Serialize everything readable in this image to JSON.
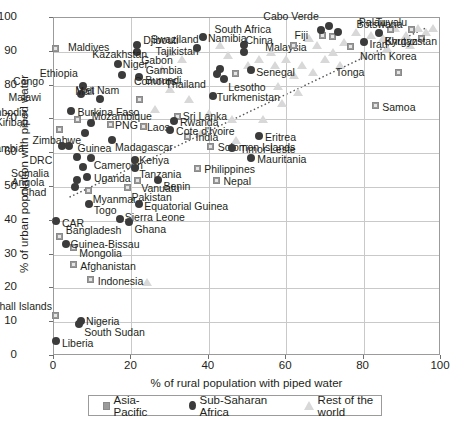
{
  "chart_data": {
    "type": "scatter",
    "title": "",
    "xlabel": "% of rural population with piped water",
    "ylabel": "% of urban population with piped water",
    "xlim": [
      0,
      100
    ],
    "ylim": [
      0,
      100
    ],
    "xticks": [
      0,
      20,
      40,
      60,
      80,
      100
    ],
    "yticks": [
      0,
      10,
      20,
      30,
      40,
      50,
      60,
      70,
      80,
      90,
      100
    ],
    "grid": true,
    "legend_position": "bottom",
    "legend": [
      {
        "label": "Asia-Pacific",
        "marker": "square",
        "color": "#9a9a9a"
      },
      {
        "label": "Sub-Saharan Africa",
        "marker": "circle",
        "color": "#3b3b3b"
      },
      {
        "label": "Rest of the world",
        "marker": "triangle",
        "color": "#d8d8d8"
      }
    ],
    "series": [
      {
        "name": "Asia-Pacific",
        "marker": "square",
        "color": "#9a9a9a",
        "points": [
          {
            "label": "Maldives",
            "x": 0.5,
            "y": 91,
            "lx": 12,
            "ly": -5
          },
          {
            "label": "Viet Nam",
            "x": 22,
            "y": 76,
            "lx": -18,
            "ly": -13
          },
          {
            "label": "Kiribati",
            "x": 1.5,
            "y": 67,
            "lx": -30,
            "ly": -12
          },
          {
            "label": "Cambodia",
            "x": 6,
            "y": 70,
            "lx": -48,
            "ly": -11
          },
          {
            "label": "PNG",
            "x": 14.5,
            "y": 68.5,
            "lx": 5,
            "ly": -3
          },
          {
            "label": "Laos",
            "x": 23,
            "y": 68,
            "lx": 4,
            "ly": -3
          },
          {
            "label": "Sri Lanka",
            "x": 32,
            "y": 71,
            "lx": 5,
            "ly": -4
          },
          {
            "label": "India",
            "x": 34.5,
            "y": 65,
            "lx": 8,
            "ly": -3
          },
          {
            "label": "Solomon Islands",
            "x": 40.5,
            "y": 62,
            "lx": 7,
            "ly": -3
          },
          {
            "label": "Nepal",
            "x": 42,
            "y": 52,
            "lx": 7,
            "ly": -3
          },
          {
            "label": "Philippines",
            "x": 37,
            "y": 55.5,
            "lx": 7,
            "ly": -3
          },
          {
            "label": "Vanuatu",
            "x": 21.5,
            "y": 52,
            "lx": 4,
            "ly": 4
          },
          {
            "label": "Pakistan",
            "x": 19,
            "y": 50,
            "lx": 4,
            "ly": 6
          },
          {
            "label": "Myanmar",
            "x": 9,
            "y": 49,
            "lx": 4,
            "ly": 5
          },
          {
            "label": "Bangladesh",
            "x": 1.5,
            "y": 35.5,
            "lx": 6,
            "ly": -10
          },
          {
            "label": "Mongolia",
            "x": 5,
            "y": 32,
            "lx": 6,
            "ly": 1
          },
          {
            "label": "Afghanistan",
            "x": 5,
            "y": 27,
            "lx": 7,
            "ly": -3
          },
          {
            "label": "Indonesia",
            "x": 9.5,
            "y": 22.5,
            "lx": 7,
            "ly": -3
          },
          {
            "label": "Marshall Islands",
            "x": 0.5,
            "y": 12,
            "lx": -2,
            "ly": -13
          },
          {
            "label": "Thailand",
            "x": 47,
            "y": 83.5,
            "lx": -28,
            "ly": 6
          },
          {
            "label": "Samoa",
            "x": 83,
            "y": 74,
            "lx": 7,
            "ly": -3
          },
          {
            "label": "Tonga",
            "x": 89,
            "y": 84,
            "lx": -32,
            "ly": -4
          },
          {
            "label": "North Korea",
            "x": 76.5,
            "y": 91.5,
            "lx": 10,
            "ly": 5
          },
          {
            "label": "Malaysia",
            "x": 72,
            "y": 94.5,
            "lx": -24,
            "ly": 6
          },
          {
            "label": "Fiji",
            "x": 69.5,
            "y": 94.8,
            "lx": -13,
            "ly": -5
          },
          {
            "label": "China",
            "x": 62,
            "y": 92,
            "lx": -19,
            "ly": -9
          },
          {
            "label": "Palau",
            "x": 87,
            "y": 96.5,
            "lx": -3,
            "ly": -12
          },
          {
            "label": "Tuvalu",
            "x": 92.5,
            "y": 96.5,
            "lx": -3,
            "ly": -12
          },
          {
            "label": "Bhutan",
            "x": 95,
            "y": 94,
            "lx": -2,
            "ly": -1
          }
        ]
      },
      {
        "name": "Sub-Saharan Africa",
        "marker": "circle",
        "color": "#3b3b3b",
        "points": [
          {
            "label": "Djibouti",
            "x": 21.5,
            "y": 92,
            "lx": 6,
            "ly": -9
          },
          {
            "label": "Gabon",
            "x": 21.5,
            "y": 90,
            "lx": 4,
            "ly": 4
          },
          {
            "label": "Niger",
            "x": 16.5,
            "y": 86.5,
            "lx": 5,
            "ly": -4
          },
          {
            "label": "Ethiopia",
            "x": 17.5,
            "y": 83,
            "lx": -42,
            "ly": -6
          },
          {
            "label": "Burundi",
            "x": 22,
            "y": 82.5,
            "lx": 6,
            "ly": -1
          },
          {
            "label": "Congo",
            "x": 7.5,
            "y": 80,
            "lx": -37,
            "ly": -9
          },
          {
            "label": "Malawi",
            "x": 7,
            "y": 77.5,
            "lx": -38,
            "ly": -1
          },
          {
            "label": "Mali",
            "x": 12,
            "y": 76,
            "lx": -4,
            "ly": -12
          },
          {
            "label": "Burkina Faso",
            "x": 4.5,
            "y": 72.5,
            "lx": 6,
            "ly": -3
          },
          {
            "label": "Mozambique",
            "x": 9.5,
            "y": 69,
            "lx": 1,
            "ly": -11
          },
          {
            "label": "Zimbabwe",
            "x": 8,
            "y": 66,
            "lx": -2,
            "ly": 3
          },
          {
            "label": "Madagascar",
            "x": 15,
            "y": 64,
            "lx": 3,
            "ly": 3
          },
          {
            "label": "Rwanda",
            "x": 31,
            "y": 69.5,
            "lx": 6,
            "ly": -3
          },
          {
            "label": "Cote d'Ivoire",
            "x": 30,
            "y": 67,
            "lx": 6,
            "ly": -3
          },
          {
            "label": "Eritrea",
            "x": 53,
            "y": 65,
            "lx": 6,
            "ly": -3
          },
          {
            "label": "Guinea",
            "x": 4,
            "y": 62,
            "lx": 8,
            "ly": -2
          },
          {
            "label": "Zambia",
            "x": 2,
            "y": 62,
            "lx": -36,
            "ly": -2
          },
          {
            "label": "DRC",
            "x": 6,
            "y": 59,
            "lx": -23,
            "ly": -1
          },
          {
            "label": "Cameroon",
            "x": 9.5,
            "y": 58.5,
            "lx": 3,
            "ly": 3
          },
          {
            "label": "Somalia",
            "x": 7.5,
            "y": 56,
            "lx": -32,
            "ly": 2
          },
          {
            "label": "Kenya",
            "x": 21,
            "y": 58,
            "lx": 4,
            "ly": -4
          },
          {
            "label": "Tanzania",
            "x": 21,
            "y": 55.5,
            "lx": 4,
            "ly": 2
          },
          {
            "label": "Mauritania",
            "x": 51,
            "y": 58.5,
            "lx": 6,
            "ly": -3
          },
          {
            "label": "Timor-Leste",
            "x": 46,
            "y": 61.5,
            "lx": 8,
            "ly": -3
          },
          {
            "label": "Uganda",
            "x": 8.5,
            "y": 53,
            "lx": 7,
            "ly": -3
          },
          {
            "label": "Benin",
            "x": 27,
            "y": 52,
            "lx": 5,
            "ly": 2
          },
          {
            "label": "Angola",
            "x": 6,
            "y": 52,
            "lx": -31,
            "ly": -2
          },
          {
            "label": "Chad",
            "x": 5.5,
            "y": 50,
            "lx": -27,
            "ly": 1
          },
          {
            "label": "Togo",
            "x": 9,
            "y": 45,
            "lx": 5,
            "ly": 2
          },
          {
            "label": "Equatorial Guinea",
            "x": 22,
            "y": 45,
            "lx": 5,
            "ly": -2
          },
          {
            "label": "Sierra Leone",
            "x": 17,
            "y": 40.5,
            "lx": 5,
            "ly": -6
          },
          {
            "label": "Ghana",
            "x": 19.5,
            "y": 39.5,
            "lx": 5,
            "ly": 3
          },
          {
            "label": "CAR",
            "x": 0.5,
            "y": 40,
            "lx": 6,
            "ly": -2
          },
          {
            "label": "Guinea-Bissau",
            "x": 3,
            "y": 33,
            "lx": 5,
            "ly": -4
          },
          {
            "label": "Nigeria",
            "x": 7,
            "y": 10.5,
            "lx": 5,
            "ly": -4
          },
          {
            "label": "South Sudan",
            "x": 6.5,
            "y": 9.5,
            "lx": 5,
            "ly": 4
          },
          {
            "label": "Liberia",
            "x": 0.5,
            "y": 4.5,
            "lx": 6,
            "ly": -2
          },
          {
            "label": "Swaziland",
            "x": 49,
            "y": 92,
            "lx": -43,
            "ly": -10
          },
          {
            "label": "Tajikistan",
            "x": 49,
            "y": 90,
            "lx": -43,
            "ly": 0
          },
          {
            "label": "Gambia",
            "x": 43,
            "y": 85,
            "lx": -36,
            "ly": -3
          },
          {
            "label": "Comoros",
            "x": 42,
            "y": 83.5,
            "lx": -38,
            "ly": 3
          },
          {
            "label": "Lesotho",
            "x": 44,
            "y": 82,
            "lx": 4,
            "ly": 4
          },
          {
            "label": "Namibia",
            "x": 38.5,
            "y": 94.5,
            "lx": 5,
            "ly": -3
          },
          {
            "label": "Kazakhstan",
            "x": 37,
            "y": 91,
            "lx": -48,
            "ly": 2
          },
          {
            "label": "Senegal",
            "x": 51,
            "y": 84.5,
            "lx": 5,
            "ly": -2
          },
          {
            "label": "South Africa",
            "x": 69,
            "y": 96.5,
            "lx": -48,
            "ly": -5
          },
          {
            "label": "Cabo Verde",
            "x": 71,
            "y": 97.5,
            "lx": -8,
            "ly": -14
          },
          {
            "label": "Botswana",
            "x": 73.5,
            "y": 96,
            "lx": 18,
            "ly": -12
          },
          {
            "label": "Turkmenistan",
            "x": 41,
            "y": 77,
            "lx": 4,
            "ly": -3
          },
          {
            "label": "Iran",
            "x": 80,
            "y": 93,
            "lx": 6,
            "ly": -2
          },
          {
            "label": "Kyrgyzstan",
            "x": 84,
            "y": 95.5,
            "lx": 6,
            "ly": 4
          }
        ]
      },
      {
        "name": "Rest of the world",
        "marker": "triangle",
        "color": "#d8d8d8",
        "points": [
          {
            "x": 43,
            "y": 92
          },
          {
            "x": 56,
            "y": 90
          },
          {
            "x": 60,
            "y": 88
          },
          {
            "x": 28,
            "y": 85
          },
          {
            "x": 30,
            "y": 79
          },
          {
            "x": 35,
            "y": 76
          },
          {
            "x": 26,
            "y": 73
          },
          {
            "x": 40,
            "y": 72
          },
          {
            "x": 46,
            "y": 70
          },
          {
            "x": 38,
            "y": 66
          },
          {
            "x": 47,
            "y": 64
          },
          {
            "x": 54,
            "y": 70
          },
          {
            "x": 58,
            "y": 80
          },
          {
            "x": 62,
            "y": 83
          },
          {
            "x": 64,
            "y": 86
          },
          {
            "x": 66,
            "y": 94
          },
          {
            "x": 68,
            "y": 92
          },
          {
            "x": 72,
            "y": 90
          },
          {
            "x": 75,
            "y": 93
          },
          {
            "x": 78,
            "y": 96
          },
          {
            "x": 82,
            "y": 95
          },
          {
            "x": 85,
            "y": 94
          },
          {
            "x": 88,
            "y": 97
          },
          {
            "x": 91,
            "y": 95
          },
          {
            "x": 94,
            "y": 97
          },
          {
            "x": 96,
            "y": 96
          },
          {
            "x": 98,
            "y": 97
          },
          {
            "x": 57,
            "y": 86
          },
          {
            "x": 53,
            "y": 88
          },
          {
            "x": 50,
            "y": 86
          },
          {
            "x": 33,
            "y": 88
          },
          {
            "x": 30,
            "y": 90
          },
          {
            "x": 59,
            "y": 75
          },
          {
            "x": 70,
            "y": 88
          },
          {
            "x": 63,
            "y": 78
          },
          {
            "x": 24,
            "y": 22
          },
          {
            "x": 92,
            "y": 92
          },
          {
            "x": 86,
            "y": 91
          },
          {
            "x": 80,
            "y": 89
          },
          {
            "x": 74,
            "y": 86
          },
          {
            "x": 67,
            "y": 84
          },
          {
            "x": 45,
            "y": 89
          }
        ]
      }
    ],
    "trendline": {
      "style": "dotted",
      "x0": 4,
      "y0": 47,
      "x1": 96,
      "y1": 97
    }
  }
}
